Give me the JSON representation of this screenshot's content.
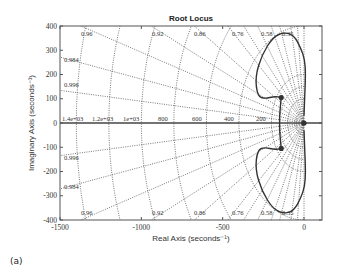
{
  "chart_data": {
    "type": "line",
    "title": "Root Locus",
    "xlabel": "Real Axis (seconds⁻¹)",
    "ylabel": "Imaginary Axis (seconds⁻¹)",
    "xlim": [
      -1500,
      110
    ],
    "ylim": [
      -400,
      400
    ],
    "xticks": [
      -1500,
      -1000,
      -500,
      0
    ],
    "yticks": [
      -400,
      -300,
      -200,
      -100,
      0,
      100,
      200,
      300,
      400
    ],
    "grid": "s-plane (damping ratio lines + natural frequency arcs)",
    "damping_ratios_top": [
      0.96,
      0.92,
      0.86,
      0.76,
      0.58,
      0.35
    ],
    "damping_ratios_left": [
      0.984,
      0.996
    ],
    "damping_ratios_all": [
      0.35,
      0.58,
      0.76,
      0.86,
      0.92,
      0.96,
      0.984,
      0.996
    ],
    "natural_frequencies": [
      200,
      400,
      600,
      800,
      1000,
      1200,
      1400
    ],
    "natural_frequency_labels": [
      "1.4e+03",
      "1.2e+03",
      "1e+03",
      "800",
      "600",
      "400",
      "200"
    ],
    "series": [
      {
        "name": "upper branch",
        "points": [
          [
            0,
            30
          ],
          [
            5,
            120
          ],
          [
            10,
            200
          ],
          [
            5,
            260
          ],
          [
            -20,
            310
          ],
          [
            -60,
            360
          ],
          [
            -120,
            375
          ],
          [
            -190,
            355
          ],
          [
            -260,
            280
          ],
          [
            -300,
            190
          ],
          [
            -285,
            110
          ],
          [
            -240,
            100
          ],
          [
            -180,
            110
          ],
          [
            -140,
            105
          ]
        ]
      },
      {
        "name": "upper branch from origin",
        "points": [
          [
            -150,
            0
          ],
          [
            -150,
            30
          ],
          [
            -145,
            70
          ],
          [
            -140,
            105
          ]
        ]
      },
      {
        "name": "lower branch",
        "points": [
          [
            0,
            -30
          ],
          [
            5,
            -120
          ],
          [
            10,
            -200
          ],
          [
            5,
            -260
          ],
          [
            -20,
            -310
          ],
          [
            -60,
            -360
          ],
          [
            -120,
            -375
          ],
          [
            -190,
            -355
          ],
          [
            -260,
            -280
          ],
          [
            -300,
            -190
          ],
          [
            -285,
            -110
          ],
          [
            -240,
            -100
          ],
          [
            -180,
            -110
          ],
          [
            -140,
            -105
          ]
        ]
      },
      {
        "name": "lower branch from origin",
        "points": [
          [
            -150,
            0
          ],
          [
            -150,
            -30
          ],
          [
            -145,
            -70
          ],
          [
            -140,
            -105
          ]
        ]
      }
    ],
    "markers": [
      [
        -140,
        105
      ],
      [
        -140,
        -105
      ],
      [
        0,
        0
      ]
    ]
  },
  "panel_label": "(a)"
}
